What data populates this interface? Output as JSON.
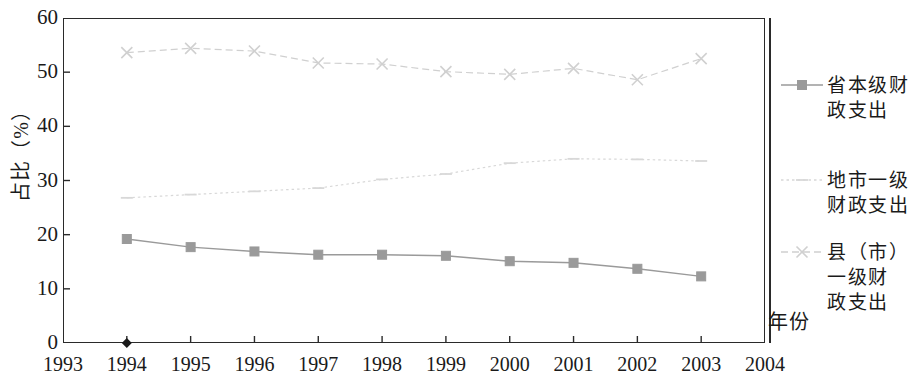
{
  "chart_data": {
    "type": "line",
    "title": "",
    "xlabel": "年份",
    "ylabel": "占比（%）",
    "x": [
      1994,
      1995,
      1996,
      1997,
      1998,
      1999,
      2000,
      2001,
      2002,
      2003
    ],
    "xtick_labels": [
      "1993",
      "1994",
      "1995",
      "1996",
      "1997",
      "1998",
      "1999",
      "2000",
      "2001",
      "2002",
      "2003",
      "2004"
    ],
    "ytick_labels": [
      "0",
      "10",
      "20",
      "30",
      "40",
      "50",
      "60"
    ],
    "ytick_values": [
      0,
      10,
      20,
      30,
      40,
      50,
      60
    ],
    "xlim": [
      1993,
      2004
    ],
    "ylim": [
      0,
      60
    ],
    "grid": false,
    "legend_position": "right",
    "series": [
      {
        "name": "省本级财政支出",
        "legend_label": "省本级财\n政支出",
        "marker": "square",
        "linestyle": "solid",
        "color": "#9a9a9a",
        "values": [
          19.2,
          17.7,
          16.9,
          16.3,
          16.3,
          16.1,
          15.1,
          14.8,
          13.7,
          12.3
        ]
      },
      {
        "name": "地市一级财政支出",
        "legend_label": "地市一级\n财政支出",
        "marker": "dash",
        "linestyle": "dotted",
        "color": "#d8d8d8",
        "values": [
          26.8,
          27.4,
          28.0,
          28.6,
          30.2,
          31.2,
          33.2,
          34.0,
          33.9,
          33.6
        ]
      },
      {
        "name": "县（市）一级财政支出",
        "legend_label": "县（市）\n一级财\n政支出",
        "marker": "cross",
        "linestyle": "dashed",
        "color": "#d0d0d0",
        "values": [
          53.6,
          54.4,
          53.9,
          51.7,
          51.5,
          50.1,
          49.6,
          50.7,
          48.6,
          52.5
        ]
      }
    ],
    "origin_marker": {
      "name": "origin-diamond-marker",
      "x": 1994,
      "y": 0,
      "color": "#1a1a1a"
    }
  }
}
